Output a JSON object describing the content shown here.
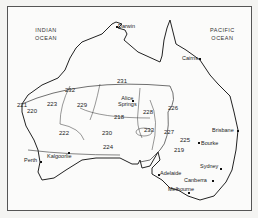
{
  "map": {
    "oceans": [
      {
        "line1": "INDIAN",
        "line2": "OCEAN"
      },
      {
        "line1": "PACIFIC",
        "line2": "OCEAN"
      }
    ],
    "cities": [
      "Darwin",
      "Cairns",
      "Alice Springs",
      "Brisbane",
      "Bourke",
      "Sydney",
      "Canberra",
      "Melbourne",
      "Adelaide",
      "Perth",
      "Kalgoorlie"
    ],
    "alice_line1": "Alice",
    "alice_line2": "Springs",
    "regions": [
      "231",
      "232",
      "223",
      "229",
      "221",
      "220",
      "222",
      "230",
      "218",
      "228",
      "226",
      "233",
      "227",
      "225",
      "219",
      "224"
    ]
  }
}
